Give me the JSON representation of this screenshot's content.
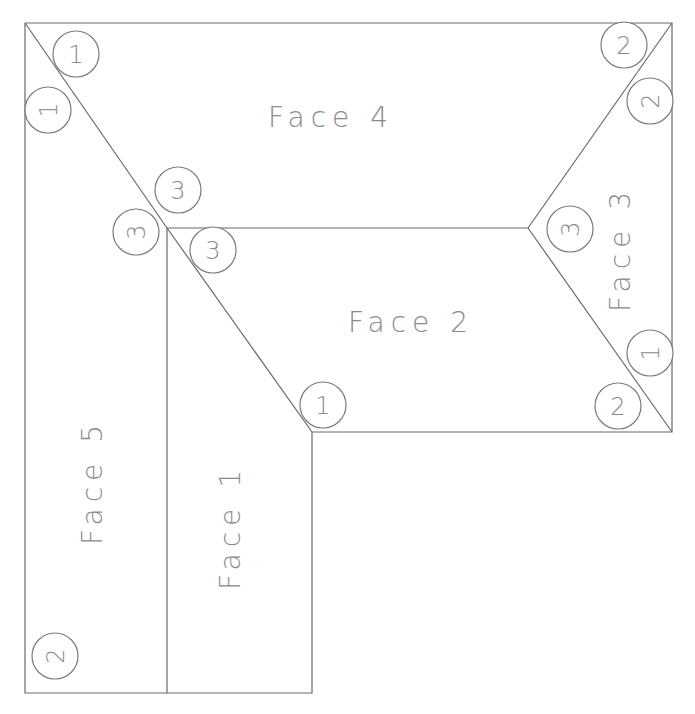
{
  "diagram": {
    "type": "roof-plan",
    "faces": [
      {
        "id": "face1",
        "label": "Face 1"
      },
      {
        "id": "face2",
        "label": "Face 2"
      },
      {
        "id": "face3",
        "label": "Face 3"
      },
      {
        "id": "face4",
        "label": "Face 4"
      },
      {
        "id": "face5",
        "label": "Face 5"
      }
    ],
    "markers": [
      {
        "label": "1"
      },
      {
        "label": "1"
      },
      {
        "label": "3"
      },
      {
        "label": "3"
      },
      {
        "label": "3"
      },
      {
        "label": "1"
      },
      {
        "label": "2"
      },
      {
        "label": "2"
      },
      {
        "label": "3"
      },
      {
        "label": "1"
      },
      {
        "label": "2"
      },
      {
        "label": "2"
      }
    ],
    "colors": {
      "line": "#6a6a6a",
      "text": "#8a8a8a"
    }
  }
}
